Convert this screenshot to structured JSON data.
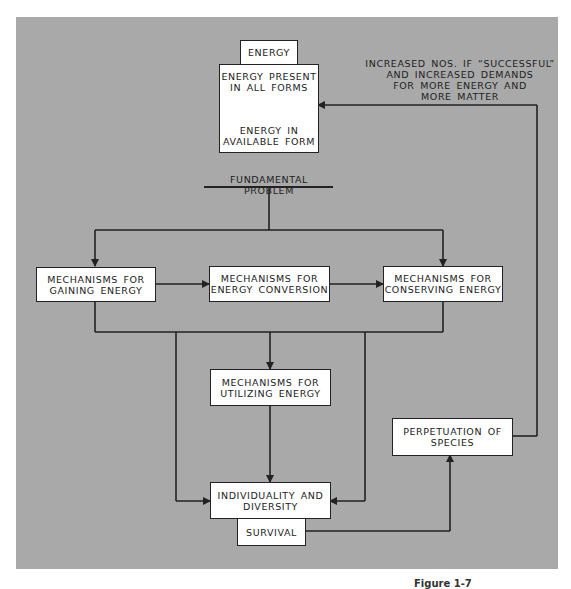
{
  "diagram": {
    "energy_tab": "ENERGY",
    "energy_box": {
      "top": "ENERGY PRESENT IN ALL FORMS",
      "top_line1": "ENERGY PRESENT",
      "top_line2": "IN ALL FORMS",
      "bottom_line1": "ENERGY IN",
      "bottom_line2": "AVAILABLE FORM"
    },
    "feedback_label": {
      "line1": "INCREASED NOS. IF “SUCCESSFUL”",
      "line2": "AND INCREASED DEMANDS",
      "line3": "FOR MORE ENERGY AND",
      "line4": "MORE MATTER"
    },
    "fundamental_problem": "FUNDAMENTAL PROBLEM",
    "nodes": {
      "gaining": {
        "line1": "MECHANISMS FOR",
        "line2": "GAINING ENERGY"
      },
      "conversion": {
        "line1": "MECHANISMS FOR",
        "line2": "ENERGY CONVERSION"
      },
      "conserving": {
        "line1": "MECHANISMS FOR",
        "line2": "CONSERVING ENERGY"
      },
      "utilizing": {
        "line1": "MECHANISMS FOR",
        "line2": "UTILIZING ENERGY"
      },
      "individuality": {
        "line1": "INDIVIDUALITY AND",
        "line2": "DIVERSITY"
      },
      "survival": "SURVIVAL",
      "perpetuation": {
        "line1": "PERPETUATION OF",
        "line2": "SPECIES"
      }
    },
    "caption": "Figure 1-7",
    "colors": {
      "panel": "#a9a9a9",
      "box": "#ffffff",
      "line": "#222222"
    }
  }
}
